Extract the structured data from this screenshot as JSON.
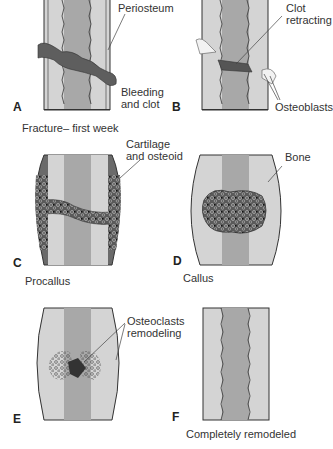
{
  "diagram": {
    "colors": {
      "cortex": "#d6d6d6",
      "marrow": "#a9a9a9",
      "clot": "#5e5e5e",
      "callus": "#6a6a6a",
      "outline": "#3a3a3a",
      "text": "#333333"
    },
    "panels": [
      {
        "letter": "A",
        "caption": "Fracture– first week",
        "labels": [
          "Periosteum",
          "Bleeding",
          "and clot"
        ]
      },
      {
        "letter": "B",
        "caption": "",
        "labels": [
          "Clot",
          "retracting",
          "Osteoblasts"
        ]
      },
      {
        "letter": "C",
        "caption": "Procallus",
        "labels": [
          "Cartilage",
          "and osteoid"
        ]
      },
      {
        "letter": "D",
        "caption": "Callus",
        "labels": [
          "Bone"
        ]
      },
      {
        "letter": "E",
        "caption": "",
        "labels": [
          "Osteoclasts",
          "remodeling"
        ]
      },
      {
        "letter": "F",
        "caption": "Completely remodeled",
        "labels": []
      }
    ]
  }
}
